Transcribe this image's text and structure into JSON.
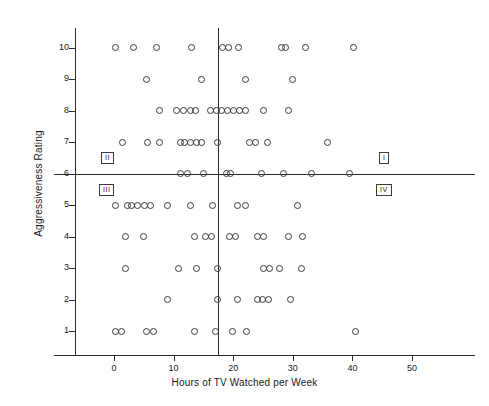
{
  "chart_data": {
    "type": "scatter",
    "title": "",
    "xlabel": "Hours of TV Watched per Week",
    "ylabel": "Aggressiveness Rating",
    "xlim": [
      -10,
      57
    ],
    "ylim": [
      0.2,
      11.2
    ],
    "grid": false,
    "legend": null,
    "xticks": [
      0,
      10,
      20,
      30,
      40,
      50
    ],
    "xtick_labels": [
      "0",
      "10",
      "20",
      "30",
      "40",
      "50"
    ],
    "yticks": [
      1,
      2,
      3,
      4,
      5,
      6,
      7,
      8,
      9,
      10
    ],
    "ytick_labels": [
      "1",
      "2",
      "3",
      "4",
      "5",
      "6",
      "7",
      "8",
      "9",
      "10"
    ],
    "reference_lines": {
      "horizontal_y": 6,
      "vertical_x": 17.5
    },
    "annotations": [
      {
        "text": "I",
        "x": 44.5,
        "y": 6.6,
        "quadrant": "upper-right"
      },
      {
        "text": "II",
        "x": 4.5,
        "y": 6.6,
        "quadrant": "upper-left"
      },
      {
        "text": "III",
        "x": 4.2,
        "y": 5.6,
        "quadrant": "lower-left"
      },
      {
        "text": "IV",
        "x": 44.0,
        "y": 5.4,
        "quadrant": "lower-right"
      }
    ],
    "marker": "open-circle",
    "marker_color": "#3a3a3a",
    "points": [
      {
        "x": 0.2,
        "y": 10
      },
      {
        "x": 3.2,
        "y": 10
      },
      {
        "x": 7.2,
        "y": 10
      },
      {
        "x": 13.0,
        "y": 10
      },
      {
        "x": 18.2,
        "y": 10
      },
      {
        "x": 19.2,
        "y": 10
      },
      {
        "x": 20.9,
        "y": 10
      },
      {
        "x": 28.1,
        "y": 10
      },
      {
        "x": 28.8,
        "y": 10
      },
      {
        "x": 32.2,
        "y": 10
      },
      {
        "x": 40.2,
        "y": 10
      },
      {
        "x": 5.4,
        "y": 9
      },
      {
        "x": 14.7,
        "y": 9
      },
      {
        "x": 22.0,
        "y": 9
      },
      {
        "x": 30.0,
        "y": 9
      },
      {
        "x": 7.6,
        "y": 8
      },
      {
        "x": 10.5,
        "y": 8
      },
      {
        "x": 11.7,
        "y": 8
      },
      {
        "x": 12.9,
        "y": 8
      },
      {
        "x": 13.7,
        "y": 8
      },
      {
        "x": 16.2,
        "y": 8
      },
      {
        "x": 17.2,
        "y": 8
      },
      {
        "x": 18.0,
        "y": 8
      },
      {
        "x": 19.0,
        "y": 8
      },
      {
        "x": 20.0,
        "y": 8
      },
      {
        "x": 21.0,
        "y": 8
      },
      {
        "x": 22.1,
        "y": 8
      },
      {
        "x": 25.1,
        "y": 8
      },
      {
        "x": 29.3,
        "y": 8
      },
      {
        "x": 1.4,
        "y": 7
      },
      {
        "x": 5.6,
        "y": 7
      },
      {
        "x": 7.6,
        "y": 7
      },
      {
        "x": 11.1,
        "y": 7
      },
      {
        "x": 11.9,
        "y": 7
      },
      {
        "x": 12.8,
        "y": 7
      },
      {
        "x": 13.8,
        "y": 7
      },
      {
        "x": 14.6,
        "y": 7
      },
      {
        "x": 17.3,
        "y": 7
      },
      {
        "x": 22.8,
        "y": 7
      },
      {
        "x": 23.8,
        "y": 7
      },
      {
        "x": 25.8,
        "y": 7
      },
      {
        "x": 35.9,
        "y": 7
      },
      {
        "x": 11.1,
        "y": 6
      },
      {
        "x": 12.4,
        "y": 6
      },
      {
        "x": 15.1,
        "y": 6
      },
      {
        "x": 18.8,
        "y": 6
      },
      {
        "x": 19.6,
        "y": 6
      },
      {
        "x": 24.7,
        "y": 6
      },
      {
        "x": 28.4,
        "y": 6
      },
      {
        "x": 33.1,
        "y": 6
      },
      {
        "x": 39.5,
        "y": 6
      },
      {
        "x": 0.2,
        "y": 5
      },
      {
        "x": 2.2,
        "y": 5
      },
      {
        "x": 3.0,
        "y": 5
      },
      {
        "x": 4.0,
        "y": 5
      },
      {
        "x": 5.2,
        "y": 5
      },
      {
        "x": 6.1,
        "y": 5
      },
      {
        "x": 8.9,
        "y": 5
      },
      {
        "x": 12.9,
        "y": 5
      },
      {
        "x": 16.5,
        "y": 5
      },
      {
        "x": 20.8,
        "y": 5
      },
      {
        "x": 22.0,
        "y": 5
      },
      {
        "x": 30.8,
        "y": 5
      },
      {
        "x": 1.9,
        "y": 4
      },
      {
        "x": 5.0,
        "y": 4
      },
      {
        "x": 13.5,
        "y": 4
      },
      {
        "x": 15.3,
        "y": 4
      },
      {
        "x": 16.3,
        "y": 4
      },
      {
        "x": 19.3,
        "y": 4
      },
      {
        "x": 20.4,
        "y": 4
      },
      {
        "x": 24.1,
        "y": 4
      },
      {
        "x": 25.1,
        "y": 4
      },
      {
        "x": 29.3,
        "y": 4
      },
      {
        "x": 31.6,
        "y": 4
      },
      {
        "x": 1.9,
        "y": 3
      },
      {
        "x": 10.8,
        "y": 3
      },
      {
        "x": 13.8,
        "y": 3
      },
      {
        "x": 17.3,
        "y": 3
      },
      {
        "x": 25.1,
        "y": 3
      },
      {
        "x": 26.1,
        "y": 3
      },
      {
        "x": 27.8,
        "y": 3
      },
      {
        "x": 31.4,
        "y": 3
      },
      {
        "x": 8.9,
        "y": 2
      },
      {
        "x": 17.3,
        "y": 2
      },
      {
        "x": 20.8,
        "y": 2
      },
      {
        "x": 24.1,
        "y": 2
      },
      {
        "x": 24.9,
        "y": 2
      },
      {
        "x": 25.9,
        "y": 2
      },
      {
        "x": 29.6,
        "y": 2
      },
      {
        "x": 0.2,
        "y": 1
      },
      {
        "x": 1.2,
        "y": 1
      },
      {
        "x": 5.4,
        "y": 1
      },
      {
        "x": 6.6,
        "y": 1
      },
      {
        "x": 13.5,
        "y": 1
      },
      {
        "x": 17.1,
        "y": 1
      },
      {
        "x": 19.8,
        "y": 1
      },
      {
        "x": 22.2,
        "y": 1
      },
      {
        "x": 40.5,
        "y": 1
      }
    ]
  }
}
